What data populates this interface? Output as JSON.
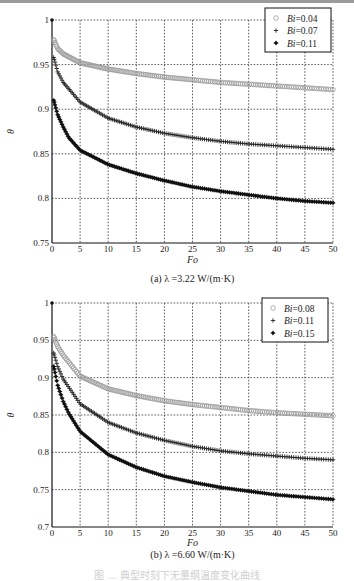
{
  "chart_data": [
    {
      "type": "scatter",
      "panel": "a",
      "caption": "(a) λ =3.22 W/(m·K)",
      "xlabel": "Fo",
      "ylabel": "θ",
      "xlim": [
        0,
        50
      ],
      "ylim": [
        0.75,
        1
      ],
      "xticks": [
        0,
        5,
        10,
        15,
        20,
        25,
        30,
        35,
        40,
        45,
        50
      ],
      "yticks": [
        0.75,
        0.8,
        0.85,
        0.9,
        0.95,
        1
      ],
      "ytick_labels": [
        "0.75",
        "0.8",
        "0.85",
        "0.9",
        "0.95",
        "1"
      ],
      "grid": true,
      "legend_position": "upper right",
      "series": [
        {
          "name": "Bi=0.04",
          "marker": "circle",
          "x": [
            0.3,
            1,
            2,
            5,
            10,
            15,
            20,
            25,
            30,
            35,
            40,
            45,
            50
          ],
          "values": [
            0.978,
            0.968,
            0.962,
            0.952,
            0.945,
            0.94,
            0.936,
            0.933,
            0.93,
            0.928,
            0.926,
            0.924,
            0.922
          ]
        },
        {
          "name": "Bi=0.07",
          "marker": "plus",
          "x": [
            0.3,
            1,
            2,
            5,
            10,
            15,
            20,
            25,
            30,
            35,
            40,
            45,
            50
          ],
          "values": [
            0.958,
            0.942,
            0.93,
            0.908,
            0.89,
            0.88,
            0.873,
            0.868,
            0.864,
            0.861,
            0.859,
            0.857,
            0.855
          ]
        },
        {
          "name": "Bi=0.11",
          "marker": "diamond",
          "x": [
            0.3,
            1,
            2,
            3,
            5,
            10,
            15,
            20,
            25,
            30,
            35,
            40,
            45,
            50
          ],
          "values": [
            0.91,
            0.894,
            0.88,
            0.868,
            0.854,
            0.838,
            0.828,
            0.82,
            0.813,
            0.808,
            0.804,
            0.8,
            0.797,
            0.795
          ]
        }
      ]
    },
    {
      "type": "scatter",
      "panel": "b",
      "caption": "(b) λ =6.60  W/(m·K)",
      "xlabel": "Fo",
      "ylabel": "θ",
      "xlim": [
        0,
        50
      ],
      "ylim": [
        0.7,
        1
      ],
      "xticks": [
        0,
        5,
        10,
        15,
        20,
        25,
        30,
        35,
        40,
        45,
        50
      ],
      "yticks": [
        0.7,
        0.75,
        0.8,
        0.85,
        0.9,
        0.95,
        1
      ],
      "ytick_labels": [
        "0.7",
        "0.75",
        "0.8",
        "0.85",
        "0.9",
        "0.95",
        "1"
      ],
      "grid": true,
      "legend_position": "upper right",
      "series": [
        {
          "name": "Bi=0.08",
          "marker": "circle",
          "x": [
            0.3,
            1,
            2,
            5,
            10,
            15,
            20,
            25,
            30,
            35,
            40,
            45,
            50
          ],
          "values": [
            0.955,
            0.942,
            0.93,
            0.902,
            0.885,
            0.876,
            0.869,
            0.864,
            0.86,
            0.856,
            0.853,
            0.851,
            0.849
          ]
        },
        {
          "name": "Bi=0.11",
          "marker": "plus",
          "x": [
            0.3,
            1,
            2,
            5,
            10,
            15,
            20,
            25,
            30,
            35,
            40,
            45,
            50
          ],
          "values": [
            0.933,
            0.915,
            0.898,
            0.865,
            0.84,
            0.826,
            0.816,
            0.808,
            0.802,
            0.798,
            0.795,
            0.792,
            0.79
          ]
        },
        {
          "name": "Bi=0.15",
          "marker": "diamond",
          "x": [
            0.3,
            1,
            2,
            3,
            5,
            10,
            15,
            20,
            25,
            30,
            35,
            40,
            45,
            50
          ],
          "values": [
            0.915,
            0.89,
            0.868,
            0.852,
            0.828,
            0.797,
            0.78,
            0.768,
            0.76,
            0.753,
            0.748,
            0.743,
            0.74,
            0.737
          ]
        }
      ]
    }
  ],
  "figure_caption": "图 ... 典型时刻下无量纲温度变化曲线"
}
